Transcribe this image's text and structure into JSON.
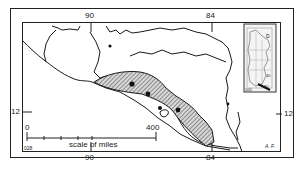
{
  "map": {
    "longitude_labels_top": [
      "90",
      "84"
    ],
    "longitude_labels_bottom": [
      "90",
      "84"
    ],
    "latitude_labels": {
      "left": "12",
      "right": "12"
    },
    "scale": {
      "start": "0",
      "end": "400",
      "caption": "scale of miles"
    },
    "corner_mark_left": "028",
    "corner_mark_right": "A. F.",
    "inset": {
      "label_top": "D",
      "label_mid": "40",
      "label_bottom_left": "100",
      "label_bottom_right": "80"
    },
    "colors": {
      "line": "#1a1a1a",
      "hatch": "#555555",
      "background": "#ffffff"
    }
  }
}
